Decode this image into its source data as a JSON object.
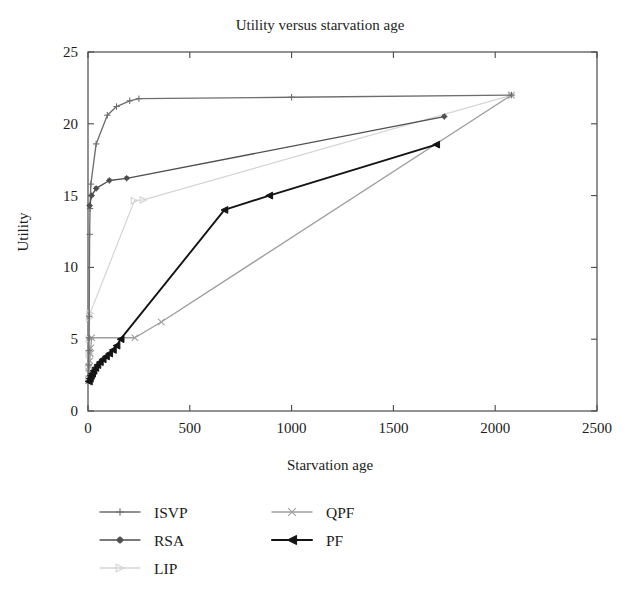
{
  "chart_data": {
    "type": "line",
    "title": "Utility versus starvation age",
    "xlabel": "Starvation age",
    "ylabel": "Utility",
    "xlim": [
      0,
      2500
    ],
    "ylim": [
      0,
      25
    ],
    "xticks": [
      0,
      500,
      1000,
      1500,
      2000,
      2500
    ],
    "yticks": [
      0,
      5,
      10,
      15,
      20,
      25
    ],
    "xtick_labels": [
      "0",
      "500",
      "1000",
      "1500",
      "2000",
      "2500"
    ],
    "ytick_labels": [
      "0",
      "5",
      "10",
      "15",
      "20",
      "25"
    ],
    "grid": false,
    "legend_position": "below-left",
    "series": [
      {
        "name": "ISVP",
        "color": "#6e6e6e",
        "marker": "plus",
        "points": [
          [
            2,
            2.1
          ],
          [
            3,
            3.2
          ],
          [
            4,
            4.2
          ],
          [
            5,
            5.1
          ],
          [
            6,
            6.6
          ],
          [
            8,
            12.3
          ],
          [
            10,
            14.1
          ],
          [
            14,
            15.8
          ],
          [
            40,
            18.6
          ],
          [
            95,
            20.6
          ],
          [
            140,
            21.2
          ],
          [
            205,
            21.6
          ],
          [
            250,
            21.75
          ],
          [
            1000,
            21.85
          ],
          [
            2080,
            22.0
          ]
        ]
      },
      {
        "name": "RSA",
        "color": "#4f4f4f",
        "marker": "star",
        "points": [
          [
            8,
            14.3
          ],
          [
            18,
            15.0
          ],
          [
            40,
            15.5
          ],
          [
            105,
            16.05
          ],
          [
            190,
            16.2
          ],
          [
            1750,
            20.5
          ]
        ]
      },
      {
        "name": "LIP",
        "color": "#d4d4d4",
        "marker": "triangle-right",
        "points": [
          [
            4,
            2.2
          ],
          [
            5,
            3.1
          ],
          [
            6,
            4.0
          ],
          [
            7,
            5.0
          ],
          [
            8,
            6.5
          ],
          [
            10,
            6.8
          ],
          [
            228,
            14.65
          ],
          [
            272,
            14.7
          ],
          [
            2080,
            22.0
          ]
        ]
      },
      {
        "name": "QPF",
        "color": "#9e9e9e",
        "marker": "x",
        "points": [
          [
            3,
            2.1
          ],
          [
            5,
            2.6
          ],
          [
            7,
            3.1
          ],
          [
            9,
            3.5
          ],
          [
            11,
            4.0
          ],
          [
            14,
            4.4
          ],
          [
            18,
            5.1
          ],
          [
            230,
            5.1
          ],
          [
            360,
            6.2
          ],
          [
            2080,
            22.0
          ]
        ]
      },
      {
        "name": "PF",
        "color": "#141414",
        "marker": "triangle-left",
        "points": [
          [
            4,
            2.05
          ],
          [
            9,
            2.25
          ],
          [
            14,
            2.45
          ],
          [
            20,
            2.6
          ],
          [
            27,
            2.8
          ],
          [
            36,
            3.0
          ],
          [
            46,
            3.2
          ],
          [
            58,
            3.4
          ],
          [
            72,
            3.6
          ],
          [
            88,
            3.8
          ],
          [
            104,
            4.0
          ],
          [
            122,
            4.25
          ],
          [
            140,
            4.55
          ],
          [
            160,
            5.0
          ],
          [
            670,
            14.0
          ],
          [
            890,
            15.0
          ],
          [
            1710,
            18.55
          ]
        ]
      }
    ]
  },
  "legend": {
    "entries": [
      {
        "label": "ISVP",
        "series": "ISVP"
      },
      {
        "label": "RSA",
        "series": "RSA"
      },
      {
        "label": "LIP",
        "series": "LIP"
      },
      {
        "label": "QPF",
        "series": "QPF"
      },
      {
        "label": "PF",
        "series": "PF"
      }
    ]
  }
}
